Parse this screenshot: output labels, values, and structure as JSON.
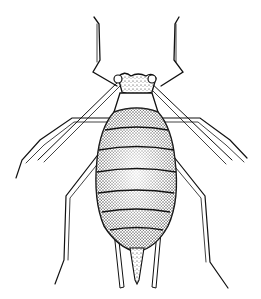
{
  "image": {
    "subject": "aphid illustration",
    "style": "black ink stipple drawing on white",
    "colors": {
      "background": "#ffffff",
      "ink": "#111111",
      "shade": "#555555"
    },
    "parts": [
      "antennae",
      "head",
      "thorax",
      "segmented abdomen",
      "six legs",
      "cornicles",
      "cauda"
    ]
  }
}
